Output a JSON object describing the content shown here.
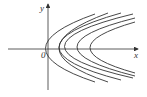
{
  "figure": {
    "axes": {
      "x_label": "x",
      "y_label": "y",
      "origin_label": "0"
    },
    "curves": [
      {
        "vertex_px": 22,
        "upper_end": [
          95,
          14
        ],
        "lower_end": [
          95,
          82
        ]
      },
      {
        "vertex_px": 36,
        "upper_end": [
          108,
          13
        ],
        "lower_end": [
          108,
          82
        ]
      },
      {
        "vertex_px": 48,
        "upper_end": [
          121,
          13
        ],
        "lower_end": [
          121,
          80
        ]
      },
      {
        "vertex_px": 62,
        "upper_end": [
          133,
          14
        ],
        "lower_end": [
          133,
          78
        ]
      },
      {
        "vertex_px": 77,
        "upper_end": [
          135,
          18
        ],
        "lower_end": [
          135,
          76
        ]
      },
      {
        "vertex_px": 90,
        "upper_end": [
          135,
          22
        ],
        "lower_end": [
          135,
          73
        ]
      }
    ],
    "colors": {
      "line": "#333333",
      "background": "#ffffff"
    }
  }
}
